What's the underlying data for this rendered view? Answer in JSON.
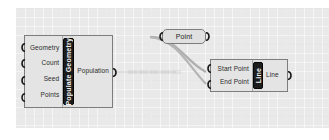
{
  "canvas": {
    "background_color": "#e9e9e9",
    "grid_color": "#9a9a9a"
  },
  "nodes": [
    {
      "id": "populate-geometry",
      "name": "Populate Geometry",
      "type": "component",
      "inputs": [
        "Geometry",
        "Count",
        "Seed",
        "Points"
      ],
      "outputs": [
        "Population"
      ],
      "label_color": "#1c1c1c",
      "label_text_color": "#f2f2f2"
    },
    {
      "id": "point",
      "name": "Point",
      "type": "parameter",
      "inputs": [],
      "outputs": []
    },
    {
      "id": "line",
      "name": "Line",
      "type": "component",
      "inputs": [
        "Start Point",
        "End Point"
      ],
      "outputs": [
        "Line"
      ],
      "label_color": "#1c1c1c",
      "label_text_color": "#f2f2f2"
    }
  ],
  "wires": [
    {
      "from": "point.output",
      "to": "line.start-point"
    },
    {
      "from": "point.output",
      "to": "line.end-point"
    }
  ],
  "ghost_text": "000 000 000 000 000"
}
